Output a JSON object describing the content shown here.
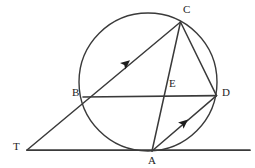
{
  "figure": {
    "width": 255,
    "height": 168,
    "background_color": "#ffffff",
    "stroke_color": "#3a3a3a",
    "label_color": "#1d1d1d"
  },
  "circle": {
    "name": "circle",
    "cx": 148,
    "cy": 82,
    "r": 69,
    "stroke_width": 1.4
  },
  "points": [
    {
      "id": "T",
      "label": "T",
      "x": 27,
      "y": 150,
      "label_x": 13,
      "label_y": 142,
      "on_circle": false
    },
    {
      "id": "B",
      "label": "B",
      "x": 83,
      "y": 97,
      "label_x": 72,
      "label_y": 88,
      "on_circle": true
    },
    {
      "id": "C",
      "label": "C",
      "x": 180,
      "y": 22,
      "label_x": 183,
      "label_y": 5,
      "on_circle": true
    },
    {
      "id": "D",
      "label": "D",
      "x": 216,
      "y": 96,
      "label_x": 222,
      "label_y": 88,
      "on_circle": true
    },
    {
      "id": "E",
      "label": "E",
      "x": 167,
      "y": 96,
      "label_x": 169,
      "label_y": 79,
      "on_circle": false
    },
    {
      "id": "A",
      "label": "A",
      "x": 152,
      "y": 151,
      "label_x": 148,
      "label_y": 155,
      "on_circle": true
    }
  ],
  "segments": [
    {
      "name": "tangent-line-TA-extended",
      "from": "T",
      "to": "far-right",
      "x1": 27,
      "y1": 150,
      "x2": 250,
      "y2": 150,
      "arrow": false
    },
    {
      "name": "secant-line-TBC",
      "from": "T",
      "to": "C",
      "x1": 27,
      "y1": 150,
      "x2": 180,
      "y2": 22,
      "arrow": true,
      "arrow_x": 128,
      "arrow_y": 62,
      "arrow_angle": -40
    },
    {
      "name": "chord-BD",
      "from": "B",
      "to": "D",
      "x1": 83,
      "y1": 97,
      "x2": 216,
      "y2": 96,
      "arrow": false
    },
    {
      "name": "chord-CA",
      "from": "C",
      "to": "A",
      "x1": 180,
      "y1": 22,
      "x2": 152,
      "y2": 151,
      "arrow": false
    },
    {
      "name": "chord-CD",
      "from": "C",
      "to": "D",
      "x1": 180,
      "y1": 22,
      "x2": 216,
      "y2": 96,
      "arrow": false
    },
    {
      "name": "chord-AD",
      "from": "A",
      "to": "D",
      "x1": 152,
      "y1": 151,
      "x2": 216,
      "y2": 96,
      "arrow": true,
      "arrow_x": 186,
      "arrow_y": 122,
      "arrow_angle": -40
    }
  ],
  "arrow_markers": [
    {
      "name": "arrow-on-TC",
      "segment": "secant-line-TBC",
      "direction": "toward-C"
    },
    {
      "name": "arrow-on-AD",
      "segment": "chord-AD",
      "direction": "toward-D"
    }
  ]
}
